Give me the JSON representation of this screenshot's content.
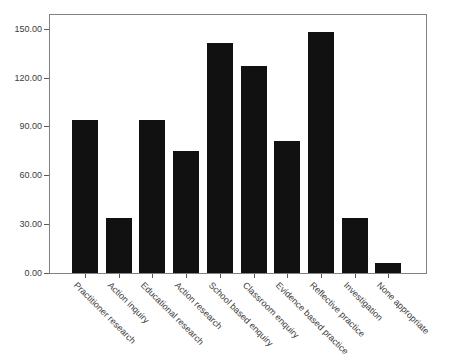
{
  "chart_data": {
    "type": "bar",
    "title": "",
    "xlabel": "",
    "ylabel": "",
    "categories": [
      "Practitioner research",
      "Action inquiry",
      "Educational research",
      "Action research",
      "School based enquiry",
      "Classroom enquiry",
      "Evidence based practice",
      "Reflective practice",
      "Investigation",
      "None appropriate"
    ],
    "values": [
      94,
      34,
      94,
      75,
      141,
      127,
      81,
      148,
      34,
      6
    ],
    "yticks": [
      0,
      30,
      60,
      90,
      120,
      150
    ],
    "ytick_labels": [
      "0.00",
      "30.00",
      "60.00",
      "90.00",
      "120.00",
      "150.00"
    ],
    "ylim": [
      0,
      159
    ],
    "grid": false,
    "legend": false,
    "x_label_rotation_deg": 45,
    "bar_color": "#111111",
    "frame_color": "#828282",
    "tick_color": "#5a5a5a",
    "text_color": "#3c3c3c",
    "background": "#ffffff"
  }
}
